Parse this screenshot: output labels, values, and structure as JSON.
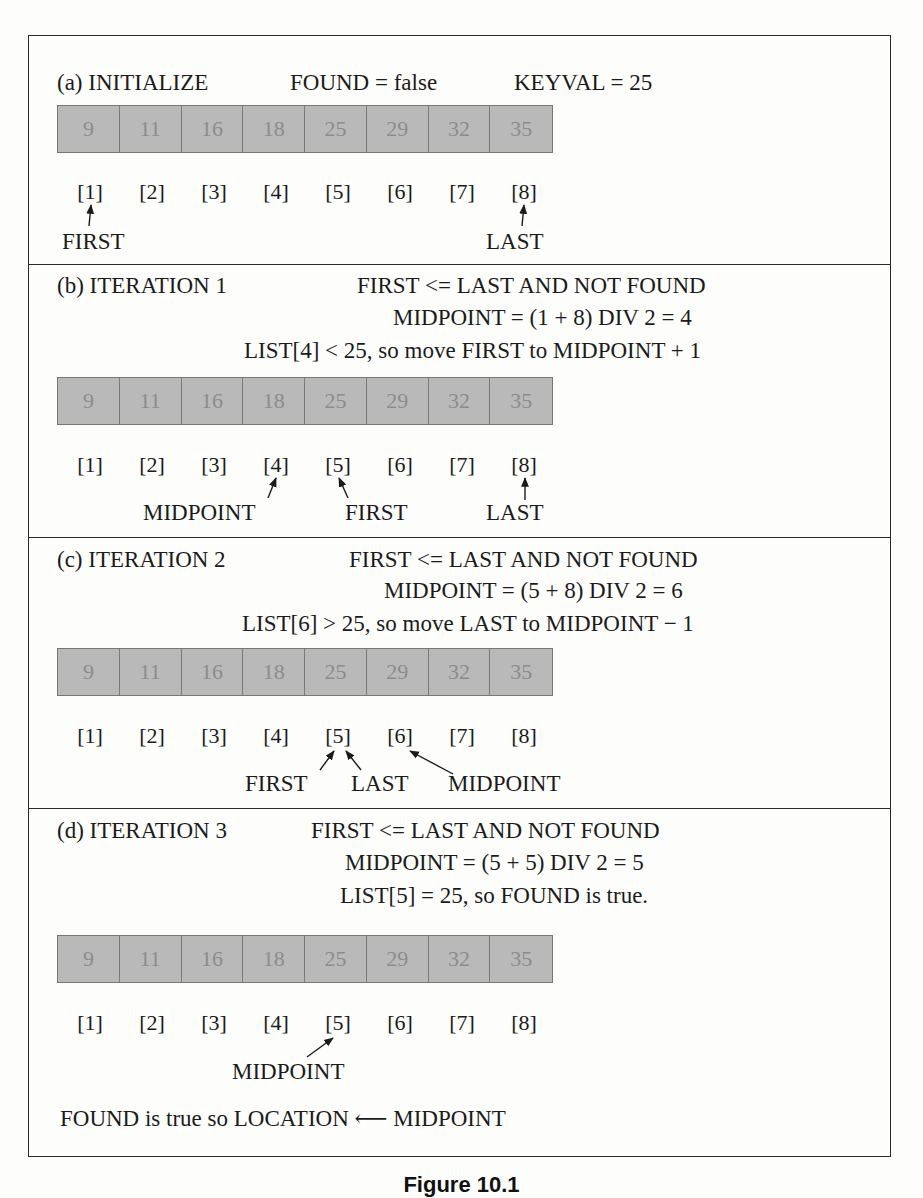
{
  "figure": {
    "caption": "Figure 10.1",
    "list_values": [
      "9",
      "11",
      "16",
      "18",
      "25",
      "29",
      "32",
      "35"
    ],
    "indices": [
      "[1]",
      "[2]",
      "[3]",
      "[4]",
      "[5]",
      "[6]",
      "[7]",
      "[8]"
    ],
    "colors": {
      "cell_fill": "#b9b9b9",
      "cell_text": "#8c8c8c",
      "cell_border": "#777777",
      "rule": "#2a2a2a"
    }
  },
  "sections": [
    {
      "id": "a",
      "heading": "(a) INITIALIZE",
      "line1": "FOUND = false",
      "line1b": "KEYVAL = 25",
      "pointers": [
        {
          "label": "FIRST",
          "index": 1
        },
        {
          "label": "LAST",
          "index": 8
        }
      ]
    },
    {
      "id": "b",
      "heading": "(b) ITERATION 1",
      "line1": "FIRST <= LAST AND NOT FOUND",
      "line2": "MIDPOINT = (1 + 8) DIV 2 = 4",
      "line3": "LIST[4] < 25, so move FIRST to MIDPOINT + 1",
      "pointers": [
        {
          "label": "MIDPOINT",
          "index": 4
        },
        {
          "label": "FIRST",
          "index": 5
        },
        {
          "label": "LAST",
          "index": 8
        }
      ]
    },
    {
      "id": "c",
      "heading": "(c) ITERATION 2",
      "line1": "FIRST <= LAST AND NOT FOUND",
      "line2": "MIDPOINT = (5 + 8) DIV 2 = 6",
      "line3": "LIST[6] > 25, so move LAST to MIDPOINT − 1",
      "pointers": [
        {
          "label": "FIRST",
          "index": 5
        },
        {
          "label": "LAST",
          "index": 5
        },
        {
          "label": "MIDPOINT",
          "index": 6
        }
      ]
    },
    {
      "id": "d",
      "heading": "(d) ITERATION 3",
      "line1": "FIRST <= LAST AND NOT FOUND",
      "line2": "MIDPOINT = (5 + 5) DIV 2 = 5",
      "line3": "LIST[5] = 25, so FOUND is true.",
      "pointers": [
        {
          "label": "MIDPOINT",
          "index": 5
        }
      ],
      "conclusion": "FOUND is true so LOCATION ⟵ MIDPOINT"
    }
  ]
}
